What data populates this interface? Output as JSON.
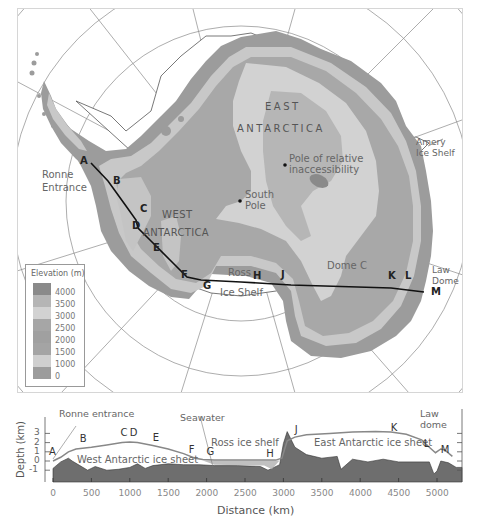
{
  "map": {
    "regions": {
      "east": [
        "EAST",
        "ANTARCTICA"
      ],
      "west": [
        "WEST",
        "ANTARCTICA"
      ]
    },
    "places": {
      "ronne": [
        "Ronne",
        "Entrance"
      ],
      "pole_inacc": [
        "Pole of relative",
        "inaccessibility"
      ],
      "south_pole": [
        "South",
        "Pole"
      ],
      "amery": [
        "Amery",
        "Ice Shelf"
      ],
      "ross": "Ross",
      "ross_shelf": "Ice Shelf",
      "dome_c": "Dome C",
      "law_dome": [
        "Law",
        "Dome"
      ]
    },
    "transect_points": [
      "A",
      "B",
      "C",
      "D",
      "E",
      "F",
      "G",
      "H",
      "J",
      "K",
      "L",
      "M"
    ],
    "colors": {
      "ocean": "#ffffff",
      "elev_0": "#9a9a9a",
      "elev_1000": "#c4c4c4",
      "elev_1500": "#a3a3a3",
      "elev_2000": "#a8a8a8",
      "elev_2500": "#adadad",
      "elev_3000": "#d0d0d0",
      "elev_3500": "#b8b8b8",
      "elev_4000": "#8a8a8a",
      "graticule": "#888888",
      "transect": "#111111"
    }
  },
  "legend": {
    "title": "Elevation (m)",
    "items": [
      {
        "value": "4000",
        "color": "#8a8a8a"
      },
      {
        "value": "3500",
        "color": "#b5b5b5"
      },
      {
        "value": "3000",
        "color": "#d2d2d2"
      },
      {
        "value": "2500",
        "color": "#a6a6a6"
      },
      {
        "value": "2000",
        "color": "#a0a0a0"
      },
      {
        "value": "1500",
        "color": "#a4a4a4"
      },
      {
        "value": "1000",
        "color": "#cfcfcf"
      },
      {
        "value": "0",
        "color": "#9c9c9c"
      }
    ]
  },
  "chart_data": {
    "type": "area",
    "xlabel": "Distance (km)",
    "ylabel": "Depth (km)",
    "xlim": [
      -50,
      5250
    ],
    "ylim": [
      -1.5,
      3.3
    ],
    "x_ticks": [
      "0",
      "500",
      "1000",
      "1500",
      "2000",
      "2500",
      "3000",
      "3500",
      "4000",
      "4500",
      "5000"
    ],
    "y_ticks": [
      "3",
      "2",
      "1",
      "0",
      "-1"
    ],
    "annotations": [
      "Ronne entrance",
      "Seawater",
      "Ross ice shelf",
      "Law dome",
      "West Antarctic ice sheet",
      "East Antarctic ice sheet"
    ],
    "point_labels": [
      {
        "label": "A",
        "x": 0,
        "y": 0.4
      },
      {
        "label": "B",
        "x": 400,
        "y": 1.8
      },
      {
        "label": "C",
        "x": 930,
        "y": 2.45
      },
      {
        "label": "D",
        "x": 1050,
        "y": 2.45
      },
      {
        "label": "E",
        "x": 1350,
        "y": 2.0
      },
      {
        "label": "F",
        "x": 1820,
        "y": 0.6
      },
      {
        "label": "G",
        "x": 2050,
        "y": 0.4
      },
      {
        "label": "H",
        "x": 2830,
        "y": 0.25
      },
      {
        "label": "J",
        "x": 3200,
        "y": 2.8
      },
      {
        "label": "K",
        "x": 4450,
        "y": 3.0
      },
      {
        "label": "L",
        "x": 4880,
        "y": 1.3
      },
      {
        "label": "M",
        "x": 5100,
        "y": 0.6
      }
    ],
    "series": [
      {
        "name": "Ice surface",
        "x": [
          0,
          100,
          200,
          300,
          500,
          700,
          900,
          1000,
          1100,
          1300,
          1500,
          1700,
          1850,
          1950,
          2100,
          2500,
          2900,
          2980,
          3050,
          3150,
          3300,
          3600,
          3900,
          4200,
          4400,
          4600,
          4800,
          4900,
          4980,
          5050,
          5100,
          5200
        ],
        "y": [
          0,
          0.4,
          1.0,
          1.3,
          1.5,
          1.75,
          2.0,
          2.05,
          2.0,
          1.7,
          1.3,
          0.8,
          0.3,
          0.15,
          0.1,
          0.1,
          0.1,
          0.3,
          2.2,
          2.6,
          2.85,
          3.0,
          3.15,
          3.2,
          3.15,
          2.9,
          2.3,
          1.5,
          0.9,
          1.3,
          1.2,
          0.5
        ]
      },
      {
        "name": "Bedrock",
        "x": [
          0,
          100,
          200,
          250,
          350,
          450,
          550,
          700,
          850,
          1000,
          1100,
          1200,
          1300,
          1500,
          1700,
          1900,
          2100,
          2400,
          2700,
          2800,
          2850,
          2950,
          3000,
          3050,
          3150,
          3300,
          3500,
          3700,
          3750,
          3900,
          4100,
          4300,
          4500,
          4700,
          4900,
          4960,
          5000,
          5050,
          5150,
          5250
        ],
        "y": [
          -0.8,
          -0.1,
          0.3,
          0.0,
          -0.5,
          -1.0,
          -0.6,
          -1.0,
          -0.9,
          -0.7,
          -0.3,
          -0.8,
          -0.5,
          -0.3,
          -0.4,
          -0.4,
          -0.5,
          -0.5,
          -0.6,
          -1.0,
          -0.8,
          -0.4,
          1.9,
          3.2,
          1.5,
          0.7,
          0.3,
          0.5,
          -0.9,
          0.2,
          -0.1,
          0.2,
          -0.1,
          -0.1,
          -0.1,
          -1.4,
          -1.1,
          0.0,
          -0.2,
          -0.7
        ]
      }
    ]
  }
}
